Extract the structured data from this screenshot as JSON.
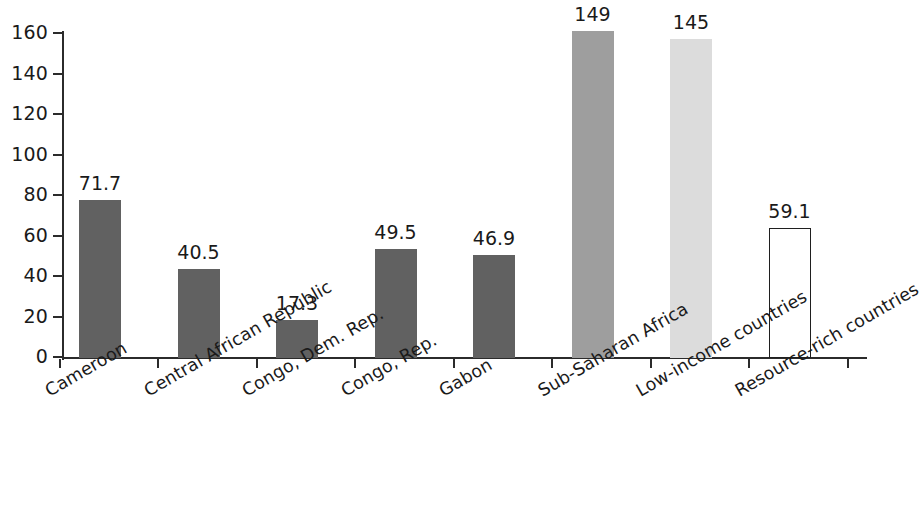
{
  "chart_data": {
    "type": "bar",
    "title": "",
    "subtitle": "",
    "xlabel": "",
    "ylabel": "",
    "ylim": [
      0,
      160
    ],
    "y_ticks": [
      0,
      20,
      40,
      60,
      80,
      100,
      120,
      140,
      160
    ],
    "grid": false,
    "legend": false,
    "categories": [
      "Cameroon",
      "Central African Republic",
      "Congo, Dem. Rep.",
      "Congo, Rep.",
      "Gabon",
      "Sub-Saharan Africa",
      "Low-income countries",
      "Resource-rich countries"
    ],
    "values": [
      71.7,
      40.5,
      17.3,
      49.5,
      46.9,
      149,
      145,
      59.1
    ],
    "value_labels": [
      "71.7",
      "40.5",
      "17.3",
      "49.5",
      "46.9",
      "149",
      "145",
      "59.1"
    ],
    "bar_styles": [
      "dark",
      "dark",
      "dark",
      "dark",
      "dark",
      "medium",
      "light",
      "none"
    ],
    "colors": {
      "dark": "#616161",
      "medium": "#9e9e9e",
      "light": "#dcdcdc",
      "none": "#ffffff",
      "outline": "#1f1f1f",
      "axis": "#2b2b2b",
      "text": "#1a1a1a",
      "background": "#ffffff"
    }
  }
}
